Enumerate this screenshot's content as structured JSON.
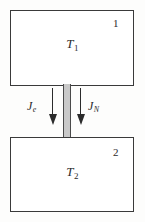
{
  "figure": {
    "kind": "two-reservoir-flux-diagram",
    "background_color": "#fdfdfc"
  },
  "reservoirs": [
    {
      "index_label": "1",
      "temperature_symbol": "T",
      "temperature_subscript": "1",
      "border_color": "#3a3a3a",
      "fill_color": "#ffffff"
    },
    {
      "index_label": "2",
      "temperature_symbol": "T",
      "temperature_subscript": "2",
      "border_color": "#3a3a3a",
      "fill_color": "#ffffff"
    }
  ],
  "channel": {
    "fill_color": "#c9c9c9",
    "border_color": "#4a4a4a"
  },
  "fluxes": [
    {
      "symbol": "J",
      "subscript": "e",
      "direction": "down",
      "side": "left",
      "color": "#2b2b2b"
    },
    {
      "symbol": "J",
      "subscript": "N",
      "direction": "down",
      "side": "right",
      "color": "#2b2b2b"
    }
  ]
}
